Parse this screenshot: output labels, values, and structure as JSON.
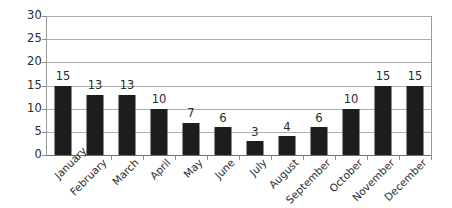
{
  "chart_data": {
    "type": "bar",
    "title": "",
    "subtitle": "",
    "xlabel": "",
    "ylabel": "",
    "categories": [
      "January",
      "February",
      "March",
      "April",
      "May",
      "June",
      "July",
      "August",
      "September",
      "October",
      "November",
      "December"
    ],
    "values": [
      15,
      13,
      13,
      10,
      7,
      6,
      3,
      4,
      6,
      10,
      15,
      15
    ],
    "data_labels": [
      "15",
      "13",
      "13",
      "10",
      "7",
      "6",
      "3",
      "4",
      "6",
      "10",
      "15",
      "15"
    ],
    "ylim": [
      0,
      30
    ],
    "y_ticks": [
      0,
      5,
      10,
      15,
      20,
      25,
      30
    ],
    "y_tick_labels": [
      "0",
      "5",
      "10",
      "15",
      "20",
      "25",
      "30"
    ],
    "grid": true,
    "grid_axis": "y",
    "legend": false,
    "legend_position": "none",
    "category_label_rotation": -45,
    "bar_color": "#1d1d1d",
    "gridline_color": "#aeaeae",
    "axis_color": "#6e6e6e",
    "text_color": "#2b2b2b",
    "background_color": "#ffffff"
  }
}
